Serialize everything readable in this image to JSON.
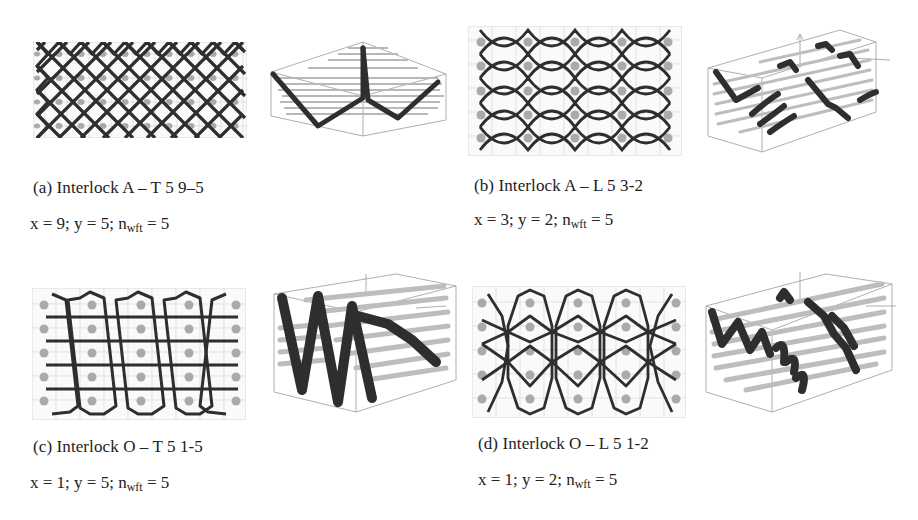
{
  "figure": {
    "panels": [
      {
        "id": "a",
        "caption": "(a) Interlock A – T 5 9–5",
        "params": {
          "x_label": "x = 9; y = 5; ",
          "n_sym": "n",
          "n_sub": "wft",
          "n_val": " = 5"
        },
        "pattern_2d": "diamond-lattice",
        "pattern_3d": "v-zigzag"
      },
      {
        "id": "b",
        "caption": "(b) Interlock A – L 5 3-2",
        "params": {
          "x_label": "x = 3; y = 2; ",
          "n_sym": "n",
          "n_sub": "wft",
          "n_val": " = 5"
        },
        "pattern_2d": "eye-lattice",
        "pattern_3d": "layer-segments"
      },
      {
        "id": "c",
        "caption": "(c) Interlock O – T 5 1-5",
        "params": {
          "x_label": "x = 1; y = 5; ",
          "n_sym": "n",
          "n_sub": "wft",
          "n_val": " = 5"
        },
        "pattern_2d": "octagon-columns-with-bars",
        "pattern_3d": "w-through-thickness"
      },
      {
        "id": "d",
        "caption": "(d) Interlock O – L 5 1-2",
        "params": {
          "x_label": "x = 1; y = 2; ",
          "n_sym": "n",
          "n_sub": "wft",
          "n_val": " = 5"
        },
        "pattern_2d": "octagon-interlaced",
        "pattern_3d": "layer-to-layer-waves"
      }
    ],
    "colors": {
      "yarn": "#2e2e2e",
      "weft_dot": "#a8a8a8",
      "grid": "#cfcfcf",
      "rod": "#bdbdbd",
      "box": "#9a9a9a"
    }
  }
}
